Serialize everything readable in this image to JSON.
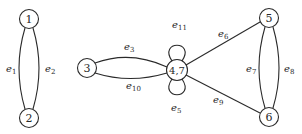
{
  "diagram": {
    "type": "multigraph",
    "nodes": [
      {
        "id": "1",
        "label": "1",
        "x": 29,
        "y": 19
      },
      {
        "id": "2",
        "label": "2",
        "x": 29,
        "y": 118
      },
      {
        "id": "3",
        "label": "3",
        "x": 87,
        "y": 68
      },
      {
        "id": "47",
        "label": "4,7",
        "x": 177,
        "y": 70
      },
      {
        "id": "5",
        "label": "5",
        "x": 269,
        "y": 18
      },
      {
        "id": "6",
        "label": "6",
        "x": 269,
        "y": 117
      }
    ],
    "edges": [
      {
        "id": "e1",
        "base": "e",
        "sub": "1",
        "from": "1",
        "to": "2"
      },
      {
        "id": "e2",
        "base": "e",
        "sub": "2",
        "from": "1",
        "to": "2"
      },
      {
        "id": "e3",
        "base": "e",
        "sub": "3",
        "from": "3",
        "to": "4,7"
      },
      {
        "id": "e10",
        "base": "e",
        "sub": "10",
        "from": "3",
        "to": "4,7"
      },
      {
        "id": "e11",
        "base": "e",
        "sub": "11",
        "from": "4,7",
        "to": "4,7",
        "loop": "top"
      },
      {
        "id": "e5",
        "base": "e",
        "sub": "5",
        "from": "4,7",
        "to": "4,7",
        "loop": "bottom"
      },
      {
        "id": "e6",
        "base": "e",
        "sub": "6",
        "from": "4,7",
        "to": "5"
      },
      {
        "id": "e9",
        "base": "e",
        "sub": "9",
        "from": "4,7",
        "to": "6"
      },
      {
        "id": "e7",
        "base": "e",
        "sub": "7",
        "from": "5",
        "to": "6"
      },
      {
        "id": "e8",
        "base": "e",
        "sub": "8",
        "from": "5",
        "to": "6"
      }
    ]
  }
}
